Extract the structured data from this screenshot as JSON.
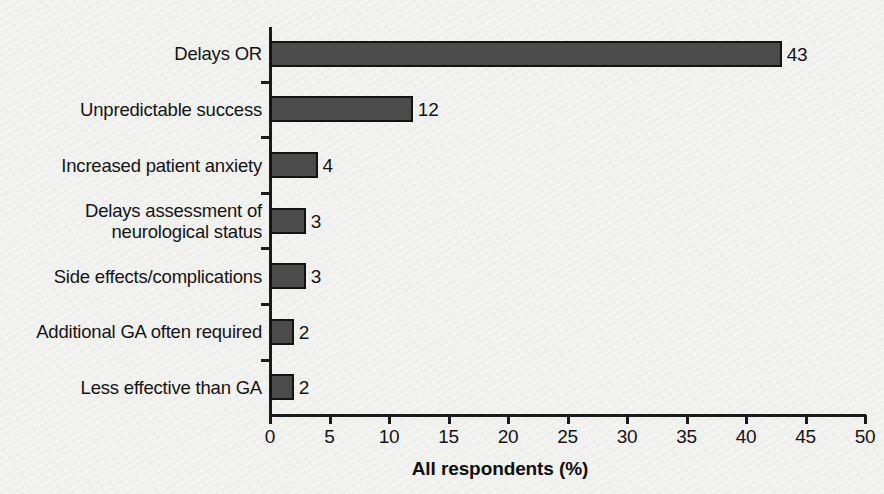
{
  "chart_data": {
    "type": "bar",
    "orientation": "horizontal",
    "title": "",
    "subtitle": "",
    "xlabel": "All respondents (%)",
    "ylabel": "",
    "xlim": [
      0,
      50
    ],
    "xticks": [
      0,
      5,
      10,
      15,
      20,
      25,
      30,
      35,
      40,
      45,
      50
    ],
    "xtick_labels": [
      "0",
      "5",
      "10",
      "15",
      "20",
      "25",
      "30",
      "35",
      "40",
      "45",
      "50"
    ],
    "grid": false,
    "legend": null,
    "categories": [
      "Delays OR",
      "Unpredictable success",
      "Increased patient anxiety",
      "Delays assessment of\nneurological status",
      "Side effects/complications",
      "Additional GA often required",
      "Less effective than GA"
    ],
    "values": [
      43,
      12,
      4,
      3,
      3,
      2,
      2
    ],
    "value_labels": [
      "43",
      "12",
      "4",
      "3",
      "3",
      "2",
      "2"
    ],
    "bar_color": "#4b4b4b",
    "bar_edge_color": "#121212",
    "background_color": "#f2f2f1",
    "axis_color": "#1b1b1b",
    "text_color": "#141414"
  }
}
